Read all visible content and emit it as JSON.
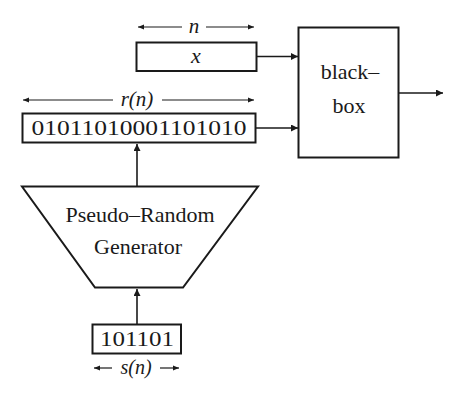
{
  "diagram": {
    "type": "block-diagram",
    "nodes": {
      "input_x": {
        "label": "x",
        "width_label": "n"
      },
      "random_string": {
        "label": "01011010001101010",
        "width_label": "r(n)"
      },
      "prg": {
        "label_line1": "Pseudo–Random",
        "label_line2": "Generator"
      },
      "seed": {
        "label": "101101",
        "width_label": "s(n)"
      },
      "blackbox": {
        "label_line1": "black–",
        "label_line2": "box"
      }
    },
    "edges": [
      {
        "from": "seed",
        "to": "prg"
      },
      {
        "from": "prg",
        "to": "random_string"
      },
      {
        "from": "input_x",
        "to": "blackbox"
      },
      {
        "from": "random_string",
        "to": "blackbox"
      },
      {
        "from": "blackbox",
        "to": "output"
      }
    ],
    "colors": {
      "ink": "#1a1a1a",
      "background": "#ffffff"
    }
  }
}
